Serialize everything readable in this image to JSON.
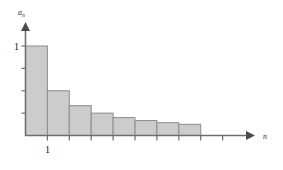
{
  "chart_data": {
    "type": "bar",
    "title": "",
    "subtitle": "",
    "xlabel": "n",
    "ylabel": "a_n",
    "ylabel_base": "a",
    "ylabel_sub": "n",
    "categories": [
      "1",
      "2",
      "3",
      "4",
      "5",
      "6",
      "7",
      "8"
    ],
    "x": [
      1,
      2,
      3,
      4,
      5,
      6,
      7,
      8
    ],
    "values": [
      1,
      0.5,
      0.3333,
      0.25,
      0.2,
      0.1667,
      0.1429,
      0.125
    ],
    "value_labels": [
      "1",
      "1/2",
      "1/3",
      "1/4",
      "1/5",
      "1/6",
      "1/7",
      "1/8"
    ],
    "xlim": [
      0,
      10
    ],
    "ylim": [
      0,
      1.22
    ],
    "x_tick_labels": [
      "1"
    ],
    "x_tick_values": [
      1
    ],
    "y_tick_labels": [
      "1"
    ],
    "y_tick_values": [
      1
    ],
    "y_minor_ticks": [
      0.25,
      0.5,
      0.75
    ],
    "x_minor_ticks": [
      2,
      3,
      4,
      5,
      6,
      7,
      8,
      9
    ],
    "grid": false,
    "legend": null,
    "annotations": [],
    "bar_fill_color": "#cccccc",
    "bar_border_color": "#8c8c8c",
    "axis_color": "#6e6e6e",
    "background_color": "#ffffff"
  },
  "axes": {
    "y_axis_label_base": "a",
    "y_axis_label_sub": "n",
    "x_axis_label": "n",
    "y_tick_one": "1",
    "x_tick_one": "1"
  }
}
